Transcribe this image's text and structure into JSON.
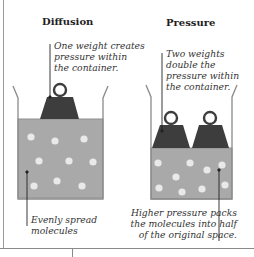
{
  "panels": {
    "diffusion": {
      "title": "Diffusion",
      "top_note": [
        "One weight creates",
        "pressure within",
        "the container."
      ],
      "bottom_note": [
        "Evenly spread",
        "molecules"
      ],
      "weights": 1,
      "molecules": [
        [
          31,
          137
        ],
        [
          55,
          141
        ],
        [
          84,
          139
        ],
        [
          39,
          161
        ],
        [
          69,
          161
        ],
        [
          93,
          162
        ],
        [
          34,
          186
        ],
        [
          57,
          181
        ],
        [
          82,
          186
        ]
      ]
    },
    "pressure": {
      "title": "Pressure",
      "top_note": [
        "Two weights",
        "double the",
        "pressure within",
        "the container."
      ],
      "bottom_note": [
        "Higher pressure packs",
        "the molecules into half",
        "of the original space."
      ],
      "weights": 2,
      "molecules": [
        [
          158,
          163
        ],
        [
          190,
          163
        ],
        [
          207,
          170
        ],
        [
          222,
          165
        ],
        [
          176,
          177
        ],
        [
          159,
          188
        ],
        [
          182,
          192
        ],
        [
          202,
          189
        ],
        [
          225,
          185
        ]
      ]
    }
  },
  "colors": {
    "liquid": "#a9a9a9",
    "liquid_edge": "#8e8e8e",
    "weight": "#3d3d3d",
    "molecule": "#e9e9e9",
    "container": "#8a8a8a",
    "leader_line": "#222222"
  }
}
